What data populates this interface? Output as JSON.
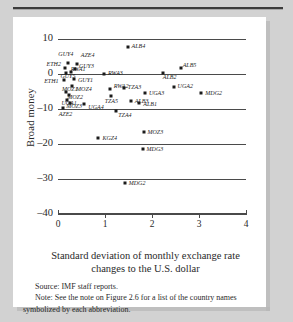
{
  "figure": {
    "ylabel": "Broad money",
    "xlabel_line1": "Standard deviation of monthly exchange rate",
    "xlabel_line2": "changes to the U.S. dollar",
    "source": "Source: IMF staff reports.",
    "note_line1": "Note: See the note on Figure 2.6 for a list of the country names",
    "note_line2": "symbolized by each abbreviation."
  },
  "chart_data": {
    "type": "scatter",
    "title": "",
    "xlabel": "Standard deviation of monthly exchange rate changes to the U.S. dollar",
    "ylabel": "Broad money",
    "xlim": [
      0,
      4
    ],
    "ylim": [
      -40,
      10
    ],
    "xticks": [
      0,
      1,
      2,
      3,
      4
    ],
    "yticks": [
      10,
      0,
      -10,
      -20,
      -30,
      -40
    ],
    "grid": "horizontal",
    "legend": "none",
    "marker": "filled-square",
    "points": [
      {
        "label": "GUY4",
        "x": 0.22,
        "y": 3.1,
        "lx": -10,
        "ly": -9
      },
      {
        "label": "AZE4",
        "x": 0.4,
        "y": 2.9,
        "lx": 4,
        "ly": -9
      },
      {
        "label": "ETH2",
        "x": 0.14,
        "y": 1.6,
        "lx": -18,
        "ly": -4
      },
      {
        "label": "GUY3",
        "x": 0.36,
        "y": 1.4,
        "lx": 4,
        "ly": -3
      },
      {
        "label": "RWA1",
        "x": 0.27,
        "y": 0.7,
        "lx": 0,
        "ly": -3
      },
      {
        "label": "GUY5",
        "x": 0.18,
        "y": 0.2,
        "lx": -6,
        "ly": 3
      },
      {
        "label": "ETH1",
        "x": 0.13,
        "y": -1.6,
        "lx": -20,
        "ly": 1
      },
      {
        "label": "GUY1",
        "x": 0.34,
        "y": -1.3,
        "lx": 4,
        "ly": 1
      },
      {
        "label": "MOZ4",
        "x": 0.3,
        "y": -3.5,
        "lx": 4,
        "ly": 3
      },
      {
        "label": "MOZ1",
        "x": 0.17,
        "y": -5.2,
        "lx": -4,
        "ly": -3
      },
      {
        "label": "MOZ2",
        "x": 0.24,
        "y": -6.0,
        "lx": -2,
        "ly": 2
      },
      {
        "label": "UGA1",
        "x": 0.2,
        "y": -7.3,
        "lx": -6,
        "ly": 3
      },
      {
        "label": "MOZ3",
        "x": 0.26,
        "y": -8.2,
        "lx": -4,
        "ly": 3
      },
      {
        "label": "UGA4",
        "x": 0.56,
        "y": -8.6,
        "lx": 4,
        "ly": 3
      },
      {
        "label": "AZE2",
        "x": 0.1,
        "y": -9.6,
        "lx": -4,
        "ly": 6
      },
      {
        "label": "RWA3",
        "x": 0.98,
        "y": 0.1,
        "lx": 4,
        "ly": -1
      },
      {
        "label": "RWA2",
        "x": 1.1,
        "y": -4.2,
        "lx": 4,
        "ly": -3
      },
      {
        "label": "TZA5",
        "x": 1.12,
        "y": -6.4,
        "lx": -6,
        "ly": 5
      },
      {
        "label": "TZA3",
        "x": 1.4,
        "y": -3.9,
        "lx": 4,
        "ly": -1
      },
      {
        "label": "ALB3",
        "x": 1.55,
        "y": -7.6,
        "lx": 4,
        "ly": 0
      },
      {
        "label": "ALB1",
        "x": 1.73,
        "y": -8.4,
        "lx": 4,
        "ly": 1
      },
      {
        "label": "TZA4",
        "x": 1.24,
        "y": -10.6,
        "lx": 2,
        "ly": 4
      },
      {
        "label": "ALB4",
        "x": 1.48,
        "y": 7.6,
        "lx": 4,
        "ly": -1
      },
      {
        "label": "ALB2",
        "x": 2.23,
        "y": 0.3,
        "lx": 0,
        "ly": 4
      },
      {
        "label": "ALB5",
        "x": 2.61,
        "y": 1.6,
        "lx": 2,
        "ly": -3
      },
      {
        "label": "UGA3",
        "x": 1.85,
        "y": -5.5,
        "lx": 4,
        "ly": 0
      },
      {
        "label": "UGA2",
        "x": 2.46,
        "y": -3.6,
        "lx": 4,
        "ly": -1
      },
      {
        "label": "MDG2",
        "x": 3.05,
        "y": -5.4,
        "lx": 4,
        "ly": 0
      },
      {
        "label": "KGZ4",
        "x": 0.86,
        "y": -18.4,
        "lx": 4,
        "ly": 0
      },
      {
        "label": "MOZ3",
        "x": 1.82,
        "y": -16.6,
        "lx": 4,
        "ly": 0
      },
      {
        "label": "MDG3",
        "x": 1.8,
        "y": -21.5,
        "lx": 4,
        "ly": 0
      },
      {
        "label": "MDG2",
        "x": 1.42,
        "y": -31.0,
        "lx": 4,
        "ly": 0
      }
    ]
  }
}
